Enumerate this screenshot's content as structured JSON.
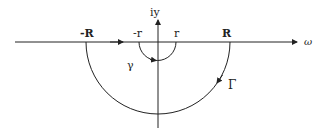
{
  "diagram": {
    "labels": {
      "vertical_axis": "iy",
      "horizontal_axis": "ω",
      "neg_R": "-R",
      "pos_R": "R",
      "neg_r": "-r",
      "pos_r": "r",
      "small_contour": "γ",
      "large_contour": "Γ"
    },
    "colors": {
      "stroke": "#222222",
      "background": "#ffffff"
    },
    "geometry": {
      "origin": [
        158,
        42
      ],
      "big_radius": 72,
      "small_radius": 18.5
    }
  }
}
